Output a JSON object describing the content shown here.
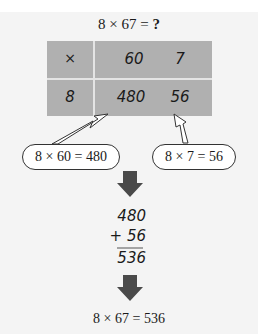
{
  "title": {
    "expression": "8 × 67 = ",
    "unknown": "?"
  },
  "grid": {
    "operator": "×",
    "header": [
      "60",
      "7"
    ],
    "row_label": "8",
    "products": [
      "480",
      "56"
    ],
    "fill_color": "#b0b0b0"
  },
  "callouts": [
    {
      "label": "8 × 60 = 480"
    },
    {
      "label": "8 × 7 = 56"
    }
  ],
  "addition": {
    "addend1": "480",
    "addend2": "+ 56",
    "sum": "536"
  },
  "result": "8 × 67 = 536",
  "arrow_color": "#4a4a4a"
}
